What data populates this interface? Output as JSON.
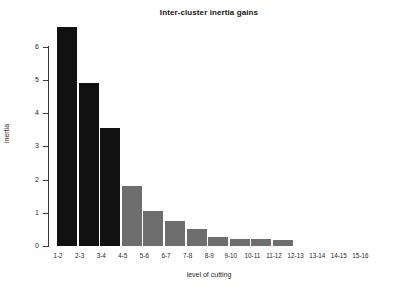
{
  "chart_data": {
    "type": "bar",
    "title": "Inter-cluster inertia gains",
    "xlabel": "level of cutting",
    "ylabel": "inertia",
    "categories": [
      "1-2",
      "2-3",
      "3-4",
      "4-5",
      "5-6",
      "6-7",
      "7-8",
      "8-9",
      "9-10",
      "10-11",
      "11-12",
      "12-13",
      "13-14",
      "14-15",
      "15-16"
    ],
    "values": [
      6.6,
      4.9,
      3.55,
      1.8,
      1.05,
      0.75,
      0.5,
      0.28,
      0.22,
      0.2,
      0.18,
      0,
      0,
      0,
      0
    ],
    "bar_colors": [
      "#111111",
      "#111111",
      "#111111",
      "#6e6e6e",
      "#6e6e6e",
      "#6e6e6e",
      "#6e6e6e",
      "#6e6e6e",
      "#6e6e6e",
      "#6e6e6e",
      "#6e6e6e",
      "#6e6e6e",
      "#6e6e6e",
      "#6e6e6e",
      "#6e6e6e"
    ],
    "ylim": [
      0,
      6
    ],
    "yticks": [
      0,
      1,
      2,
      3,
      4,
      5,
      6
    ],
    "ytick_labels": [
      "0",
      "1",
      "2",
      "3",
      "4",
      "5",
      "6"
    ],
    "grid": false,
    "legend": "none",
    "highlight_color": "#111111",
    "bar_color": "#6e6e6e",
    "axis_color": "#3a3a3a"
  }
}
